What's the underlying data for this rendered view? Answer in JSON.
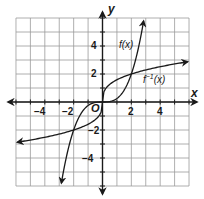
{
  "chart_data": {
    "type": "line",
    "title": "",
    "xlabel": "x",
    "ylabel": "y",
    "xlim": [
      -6,
      6
    ],
    "ylim": [
      -6,
      6
    ],
    "grid": true,
    "grid_step": 1,
    "x_tick_labels": [
      "-4",
      "-2",
      "2",
      "4"
    ],
    "x_tick_values": [
      -4,
      -2,
      2,
      4
    ],
    "y_tick_labels": [
      "4",
      "2",
      "-2",
      "-4"
    ],
    "y_tick_values": [
      4,
      2,
      -2,
      -4
    ],
    "origin_label": "O",
    "series": [
      {
        "name": "f(x)",
        "label": "f(x)",
        "formula": "x^3/4",
        "x": [
          -2.85,
          -2.5,
          -2,
          -1.5,
          -1,
          -0.5,
          0,
          0.5,
          1,
          1.5,
          2,
          2.5,
          2.85
        ],
        "y": [
          -5.79,
          -3.91,
          -2,
          -0.84,
          -0.25,
          -0.03,
          0,
          0.03,
          0.25,
          0.84,
          2,
          3.91,
          5.79
        ],
        "arrows": "both"
      },
      {
        "name": "f^-1(x)",
        "label": "f⁻¹(x)",
        "formula": "cbrt(4x)",
        "x": [
          -5.9,
          -4,
          -2,
          -1,
          -0.5,
          0,
          0.5,
          1,
          2,
          4,
          5.9
        ],
        "y": [
          -2.87,
          -2.52,
          -2,
          -1.59,
          -1.26,
          0,
          1.26,
          1.59,
          2,
          2.52,
          2.87
        ],
        "arrows": "both"
      }
    ],
    "intersections": [
      [
        -2,
        -2
      ],
      [
        0,
        0
      ],
      [
        2,
        2
      ]
    ]
  },
  "labels": {
    "x_axis": "x",
    "y_axis": "y",
    "origin": "O",
    "f": "f(x)",
    "f_inv_base": "f",
    "f_inv_sup": "−1",
    "f_inv_arg": "(x)",
    "x_ticks": [
      "−4",
      "−2",
      "2",
      "4"
    ],
    "y_ticks": [
      "4",
      "2",
      "−2",
      "−4"
    ]
  },
  "colors": {
    "grid": "#9a9a9a",
    "axis": "#1a1a1a",
    "curve": "#1a1a1a",
    "background": "#ffffff"
  }
}
